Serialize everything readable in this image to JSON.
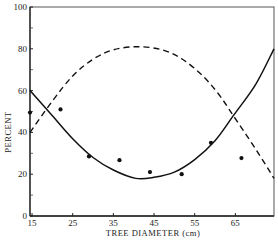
{
  "chart_data": {
    "type": "line",
    "title": "",
    "xlabel": "TREE DIAMETER (cm)",
    "ylabel": "PERCENT",
    "xlim": [
      14.5,
      74.5
    ],
    "ylim": [
      0,
      100
    ],
    "xticks": [
      15,
      25,
      35,
      45,
      55,
      65
    ],
    "yticks": [
      0,
      20,
      40,
      60,
      80,
      100
    ],
    "yminor_ticks": [
      10,
      30,
      50,
      70,
      90
    ],
    "grid": false,
    "legend": null,
    "series": [
      {
        "name": "solid-fit",
        "style": "solid",
        "points": [
          [
            14.5,
            60
          ],
          [
            20,
            48
          ],
          [
            25,
            37
          ],
          [
            30,
            28
          ],
          [
            35,
            22
          ],
          [
            40.5,
            18
          ],
          [
            45,
            18.5
          ],
          [
            50,
            21
          ],
          [
            55,
            27
          ],
          [
            60,
            36
          ],
          [
            64.5,
            48
          ],
          [
            70,
            63
          ],
          [
            74.5,
            80
          ]
        ]
      },
      {
        "name": "dashed-fit",
        "style": "dashed",
        "points": [
          [
            14.5,
            40
          ],
          [
            20,
            55
          ],
          [
            25,
            67
          ],
          [
            30,
            75
          ],
          [
            35,
            79.5
          ],
          [
            41,
            81
          ],
          [
            47,
            79.5
          ],
          [
            52,
            75
          ],
          [
            57,
            67
          ],
          [
            61,
            58
          ],
          [
            64.5,
            48
          ],
          [
            70,
            32
          ],
          [
            74.5,
            18
          ]
        ]
      },
      {
        "name": "observed",
        "style": "scatter",
        "points": [
          [
            14.5,
            49.5
          ],
          [
            22,
            51
          ],
          [
            29,
            28.5
          ],
          [
            36.5,
            26.7
          ],
          [
            44,
            21
          ],
          [
            51.8,
            20
          ],
          [
            59,
            35
          ],
          [
            66.5,
            27.7
          ]
        ]
      }
    ]
  },
  "labels": {
    "xlabel": "TREE DIAMETER (cm)",
    "ylabel": "PERCENT"
  }
}
